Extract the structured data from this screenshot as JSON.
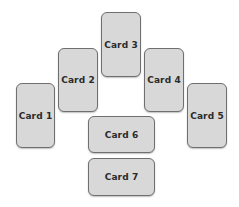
{
  "cards": [
    {
      "label": "Card 1"
    },
    {
      "label": "Card 2"
    },
    {
      "label": "Card 3"
    },
    {
      "label": "Card 4"
    },
    {
      "label": "Card 5"
    },
    {
      "label": "Card 6"
    },
    {
      "label": "Card 7"
    }
  ],
  "colors": {
    "card_fill": "#d8d8d8",
    "card_border": "#6f6f6f",
    "text": "#2a2a2a",
    "background": "#ffffff"
  }
}
